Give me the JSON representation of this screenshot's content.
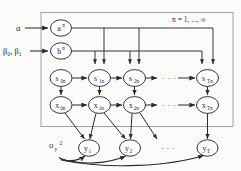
{
  "figure": {
    "type": "bayesian-plate-diagram",
    "plate_label": "n = 1, ..., ∞",
    "hyperparams": {
      "alpha": "α",
      "betas": "β₀, β₁",
      "sigma_y": "σ",
      "sigma_y_sub": "y",
      "sigma_y_sup": "2"
    },
    "param_nodes": [
      {
        "id": "a",
        "base": "a",
        "sup": "n"
      },
      {
        "id": "b",
        "base": "b",
        "sup": "n"
      }
    ],
    "state_nodes": [
      {
        "id": "s0",
        "base": "s",
        "sub": "0n"
      },
      {
        "id": "s1",
        "base": "s",
        "sub": "1n"
      },
      {
        "id": "s2",
        "base": "s",
        "sub": "2n"
      },
      {
        "id": "sT",
        "base": "s",
        "sub": "Tn"
      }
    ],
    "latent_nodes": [
      {
        "id": "x0",
        "base": "x",
        "sub": "0n"
      },
      {
        "id": "x1",
        "base": "x",
        "sub": "1n"
      },
      {
        "id": "x2",
        "base": "x",
        "sub": "2n"
      },
      {
        "id": "xT",
        "base": "x",
        "sub": "Tn"
      }
    ],
    "observed_nodes": [
      {
        "id": "y1",
        "base": "y",
        "sub": "1"
      },
      {
        "id": "y2",
        "base": "y",
        "sub": "2"
      },
      {
        "id": "yT",
        "base": "y",
        "sub": "T"
      }
    ],
    "ellipses": {
      "state_row": "·  ·  ·",
      "latent_row": "·  ·  ·",
      "observed_row": "·  ·  ·"
    },
    "colors": {
      "stroke": "#2b2b2b",
      "node_fill": "#ffffff",
      "plate_stroke": "#9a9a96",
      "background": "#fbfbfa"
    }
  }
}
